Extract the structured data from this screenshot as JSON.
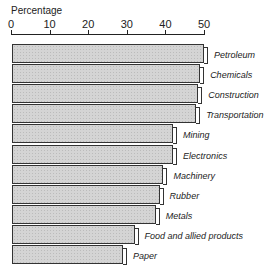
{
  "chart_data": {
    "type": "bar",
    "orientation": "horizontal",
    "title": "",
    "xlabel": "Percentage",
    "ylabel": "",
    "xlim": [
      0,
      50
    ],
    "ticks": [
      "0",
      "10",
      "20",
      "30",
      "40",
      "50"
    ],
    "grid": false,
    "categories": [
      "Petroleum",
      "Chemicals",
      "Construction",
      "Transportation",
      "Mining",
      "Electronics",
      "Machinery",
      "Rubber",
      "Metals",
      "Food and allied products",
      "Paper"
    ],
    "values": [
      50,
      49,
      48.5,
      48,
      42,
      42,
      39.5,
      38.5,
      37.5,
      32,
      29
    ]
  }
}
